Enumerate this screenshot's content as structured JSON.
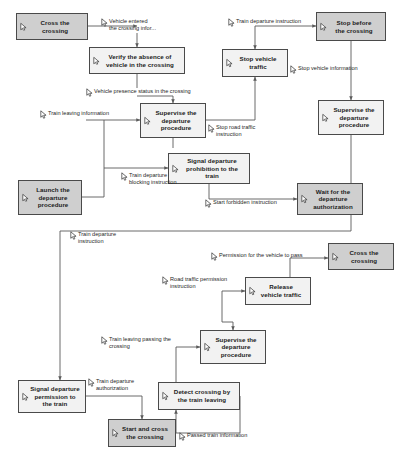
{
  "diagram": {
    "colors": {
      "node_fill_light": "#f2f2f2",
      "node_fill_dark": "#cfcfcf",
      "node_border": "#4a4a4a",
      "wire": "#5a5a5a",
      "text": "#1b1b1b"
    },
    "icon_names": {
      "node_marker": "cursor-arrow-icon",
      "label_marker": "cursor-arrow-icon"
    },
    "nodes": [
      {
        "id": "cross-the-crossing-top",
        "label": "Cross the\ncrossing",
        "shade": "dark",
        "x": 16,
        "y": 13,
        "w": 72,
        "h": 27
      },
      {
        "id": "verify-absence-of-vehicle",
        "label": "Verify the absence of\nvehicle in the crossing",
        "shade": "light",
        "x": 89,
        "y": 47,
        "w": 96,
        "h": 27
      },
      {
        "id": "stop-vehicle-traffic",
        "label": "Stop vehicle\ntraffic",
        "shade": "light",
        "x": 222,
        "y": 49,
        "w": 66,
        "h": 28
      },
      {
        "id": "stop-before-the-crossing",
        "label": "Stop before\nthe crossing",
        "shade": "dark",
        "x": 316,
        "y": 12,
        "w": 70,
        "h": 29
      },
      {
        "id": "supervise-departure-left",
        "label": "Supervise the\ndeparture\nprocedure",
        "shade": "light",
        "x": 140,
        "y": 103,
        "w": 66,
        "h": 35
      },
      {
        "id": "supervise-departure-right",
        "label": "Supervise the\ndeparture\nprocedure",
        "shade": "light",
        "x": 318,
        "y": 100,
        "w": 66,
        "h": 35
      },
      {
        "id": "launch-departure-procedure",
        "label": "Launch the\ndeparture\nprocedure",
        "shade": "dark",
        "x": 18,
        "y": 180,
        "w": 64,
        "h": 35
      },
      {
        "id": "signal-departure-prohibition",
        "label": "Signal departure\nprohibition to the\ntrain",
        "shade": "light",
        "x": 168,
        "y": 153,
        "w": 82,
        "h": 31
      },
      {
        "id": "wait-for-departure-auth",
        "label": "Wait for the\ndeparture\nauthorization",
        "shade": "dark",
        "x": 297,
        "y": 183,
        "w": 66,
        "h": 32
      },
      {
        "id": "cross-the-crossing-bottom",
        "label": "Cross the\ncrossing",
        "shade": "dark",
        "x": 328,
        "y": 243,
        "w": 66,
        "h": 27
      },
      {
        "id": "release-vehicle-traffic",
        "label": "Release\nvehicle traffic",
        "shade": "light",
        "x": 245,
        "y": 277,
        "w": 66,
        "h": 28
      },
      {
        "id": "supervise-departure-bottom",
        "label": "Supervise the\ndeparture\nprocedure",
        "shade": "light",
        "x": 200,
        "y": 330,
        "w": 66,
        "h": 34
      },
      {
        "id": "detect-crossing-by-train",
        "label": "Detect crossing by\nthe train leaving",
        "shade": "light",
        "x": 158,
        "y": 382,
        "w": 82,
        "h": 28
      },
      {
        "id": "signal-departure-permission",
        "label": "Signal departure\npermission to\nthe train",
        "shade": "light",
        "x": 18,
        "y": 380,
        "w": 68,
        "h": 33
      },
      {
        "id": "start-and-cross-the-crossing",
        "label": "Start and cross\nthe crossing",
        "shade": "dark",
        "x": 108,
        "y": 419,
        "w": 68,
        "h": 28
      }
    ],
    "edge_labels": [
      {
        "id": "vehicle-entered-crossing-info",
        "text": "Vehicle entered\nthe crossing infor...",
        "x": 101,
        "y": 18,
        "align": "left"
      },
      {
        "id": "train-departure-instruction-top",
        "text": "Train departure instruction",
        "x": 228,
        "y": 18,
        "align": "left"
      },
      {
        "id": "stop-vehicle-information",
        "text": "Stop vehicle information",
        "x": 290,
        "y": 65,
        "align": "left"
      },
      {
        "id": "vehicle-presence-status",
        "text": "Vehicle presence status in the crossing",
        "x": 86,
        "y": 88,
        "align": "left"
      },
      {
        "id": "train-leaving-information",
        "text": "Train leaving information",
        "x": 40,
        "y": 110,
        "align": "left"
      },
      {
        "id": "stop-road-traffic-instruction",
        "text": "Stop road traffic\ninstruction",
        "x": 208,
        "y": 124,
        "align": "left"
      },
      {
        "id": "train-departure-blocking",
        "text": "Train departure\nblocking instruction",
        "x": 121,
        "y": 172,
        "align": "left"
      },
      {
        "id": "start-forbidden-instruction",
        "text": "Start forbidden instruction",
        "x": 205,
        "y": 199,
        "align": "left"
      },
      {
        "id": "train-departure-instruction-mid",
        "text": "Train departure\ninstruction",
        "x": 70,
        "y": 231,
        "align": "left"
      },
      {
        "id": "permission-for-vehicle-to-pass",
        "text": "Permission for the vehicle to pass",
        "x": 211,
        "y": 252,
        "align": "left"
      },
      {
        "id": "road-traffic-permission",
        "text": "Road traffic permission\ninstruction",
        "x": 162,
        "y": 276,
        "align": "left"
      },
      {
        "id": "train-leaving-passing-crossing",
        "text": "Train leaving passing the\ncrossing",
        "x": 101,
        "y": 336,
        "align": "left"
      },
      {
        "id": "train-departure-authorization",
        "text": "Train departure\nauthorization",
        "x": 88,
        "y": 378,
        "align": "left"
      },
      {
        "id": "passed-train-information",
        "text": "Passed train information",
        "x": 179,
        "y": 432,
        "align": "left"
      }
    ]
  }
}
